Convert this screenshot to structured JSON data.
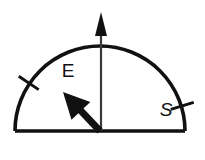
{
  "figure": {
    "name": "semicircle-angle-diagram",
    "background_color": "#ffffff",
    "ink_color": "#111111",
    "axis_color": "#3a3a3a",
    "width": 205,
    "height": 160
  },
  "geometry": {
    "origin_x": 100,
    "origin_y": 131,
    "radius": 85,
    "baseline_left_x": 15,
    "baseline_right_x": 185,
    "baseline_y": 131,
    "arc_apex_y": 46,
    "arc_stroke_width": 3.6,
    "baseline_stroke_width": 3.6
  },
  "vertical_axis": {
    "label": "vertical reference axis",
    "x": 101,
    "top_y": 12,
    "bottom_y": 131,
    "shaft_width": 2.2,
    "arrowhead": {
      "tip_y": 12,
      "base_y": 36,
      "half_width": 6
    }
  },
  "bold_arrow": {
    "label": "bold direction arrow",
    "from_x": 100,
    "from_y": 131,
    "to_x": 63,
    "to_y": 92,
    "shaft_width": 7,
    "head_length": 26,
    "head_half_width": 13,
    "direction": "up-left"
  },
  "ticks": [
    {
      "id": "tick-e",
      "label": "E",
      "angle_deg": 146,
      "inner_radius": 74,
      "outer_radius": 98,
      "stroke_width": 3.0,
      "label_x": 68,
      "label_y": 77,
      "label_font_size": 19,
      "label_style": "upright"
    },
    {
      "id": "tick-s",
      "label": "S",
      "angle_deg": 17,
      "inner_radius": 74,
      "outer_radius": 98,
      "stroke_width": 3.0,
      "label_x": 166,
      "label_y": 116,
      "label_font_size": 19,
      "label_style": "italic"
    }
  ]
}
